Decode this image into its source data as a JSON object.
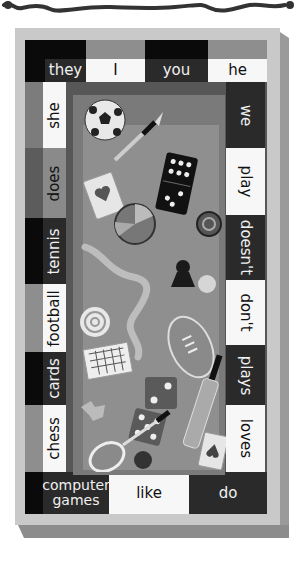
{
  "board": {
    "top_row": [
      "they",
      "I",
      "you",
      "he"
    ],
    "left_column": [
      "she",
      "does",
      "tennis",
      "football",
      "cards",
      "chess"
    ],
    "right_column": [
      "we",
      "play",
      "doesn't",
      "don't",
      "plays",
      "loves"
    ],
    "bottom_row": {
      "computer_games_line1": "computer",
      "computer_games_line2": "games",
      "like": "like",
      "do": "do"
    }
  },
  "illustration": {
    "objects": [
      "soccer-ball",
      "fountain-pen",
      "domino",
      "playing-card-heart",
      "trivial-pursuit-wheel",
      "checker-piece",
      "snake",
      "chess-pawn",
      "ball",
      "target-disc",
      "rugby-ball",
      "crossword-board",
      "jigsaw-piece",
      "die-two",
      "die-five",
      "cricket-bat",
      "tennis-racket",
      "cricket-ball",
      "playing-card-spade"
    ]
  },
  "colors": {
    "dark_cell": "#2a2a2a",
    "light_cell": "#f7f7f7",
    "board_face": "#c9c9c9",
    "board_bg": "#575757"
  }
}
